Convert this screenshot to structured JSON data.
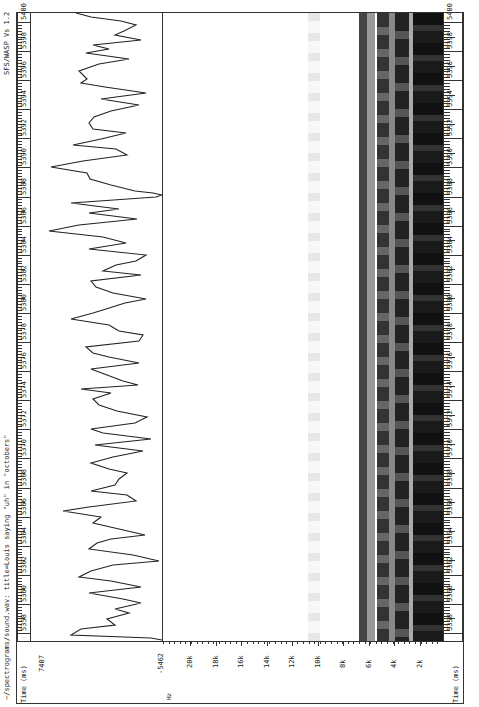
{
  "window": {
    "title": "~/spectrograms/sound.wav: title=Louis saying \"uh\" in \"octobers\"",
    "version": "SFS/WASP Vs 1.2"
  },
  "time_ruler": {
    "unit_label": "Time (ms)",
    "ticks": [
      "5358",
      "5360",
      "5362",
      "5364",
      "5366",
      "5368",
      "5370",
      "5372",
      "5374",
      "5376",
      "5378",
      "5380",
      "5382",
      "5384",
      "5386",
      "5388",
      "5390",
      "5392",
      "5394",
      "5396",
      "5398",
      "5400"
    ]
  },
  "waveform": {
    "max_label": "7407",
    "min_label": "-5462"
  },
  "spectrogram": {
    "freq_unit": "Hz",
    "freq_ticks": [
      "20k",
      "18k",
      "16k",
      "14k",
      "12k",
      "10k",
      "8k",
      "6k",
      "4k",
      "2k"
    ]
  },
  "chart_data": [
    {
      "type": "line",
      "title": "Waveform",
      "xlabel": "Time (ms)",
      "ylabel": "Amplitude",
      "xlim": [
        5357,
        5401
      ],
      "ylim": [
        -5462,
        7407
      ],
      "note": "oscillating speech waveform with peak near 5389.5 ms"
    },
    {
      "type": "heatmap",
      "title": "Spectrogram",
      "xlabel": "Time (ms)",
      "ylabel": "Hz",
      "xlim": [
        5357,
        5401
      ],
      "ylim": [
        0,
        21000
      ],
      "ytick_labels": [
        "2k",
        "4k",
        "6k",
        "8k",
        "10k",
        "12k",
        "14k",
        "16k",
        "18k",
        "20k"
      ],
      "bands_khz": [
        {
          "center": 0.5,
          "intensity": "high"
        },
        {
          "center": 1.5,
          "intensity": "high"
        },
        {
          "center": 2.6,
          "intensity": "high"
        },
        {
          "center": 3.7,
          "intensity": "high"
        },
        {
          "center": 4.6,
          "intensity": "medium"
        },
        {
          "center": 5.3,
          "intensity": "high"
        },
        {
          "center": 6.3,
          "intensity": "medium"
        },
        {
          "center": 7.0,
          "intensity": "high"
        },
        {
          "center": 8.5,
          "intensity": "low"
        },
        {
          "center": 10.3,
          "intensity": "very-low"
        }
      ]
    }
  ]
}
